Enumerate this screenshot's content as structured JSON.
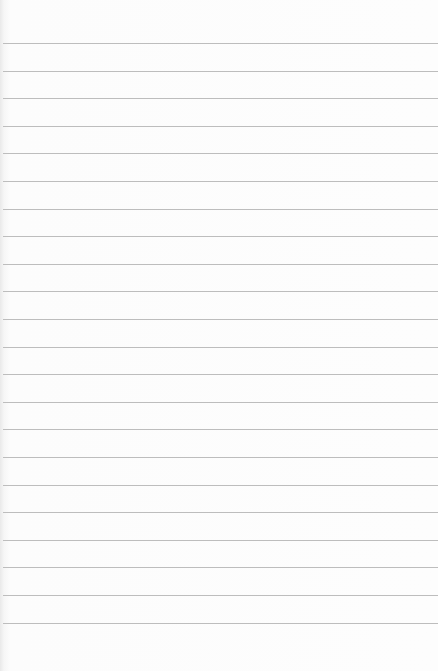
{
  "image": {
    "description": "Blank sheet of lined notebook paper",
    "paper_color": "#fcfcfc",
    "line_color": "#bdbdbd",
    "line_count": 22,
    "first_line_y": 43,
    "line_spacing_px": 27.6
  }
}
